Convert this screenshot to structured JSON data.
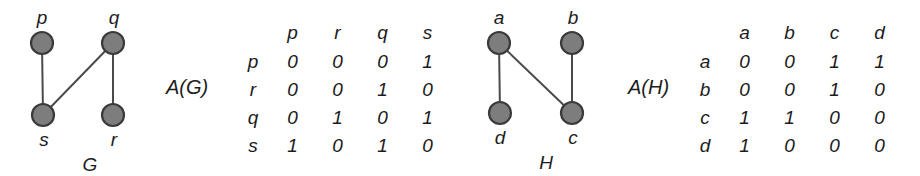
{
  "figure": {
    "background_color": "#ffffff",
    "ink_color": "#1c1c1c",
    "vertex_fill_color": "#7d7d7d",
    "vertex_stroke_color": "#3a3a3a",
    "edge_color": "#4a4a4a"
  },
  "graph_g": {
    "name": "G",
    "caption": "A(G)",
    "vertices": [
      {
        "id": "p",
        "label": "p",
        "cx": 42,
        "cy": 43,
        "r": 11,
        "label_x": 27,
        "label_y": 8
      },
      {
        "id": "q",
        "label": "q",
        "cx": 113,
        "cy": 43,
        "r": 11,
        "label_x": 99,
        "label_y": 8
      },
      {
        "id": "s",
        "label": "s",
        "cx": 43,
        "cy": 115,
        "r": 11,
        "label_x": 29,
        "label_y": 130
      },
      {
        "id": "r",
        "label": "r",
        "cx": 113,
        "cy": 115,
        "r": 11,
        "label_x": 99,
        "label_y": 130
      }
    ],
    "edges": [
      {
        "from": "p",
        "to": "s"
      },
      {
        "from": "s",
        "to": "q"
      },
      {
        "from": "q",
        "to": "r"
      }
    ],
    "name_x": 70,
    "name_y": 155
  },
  "graph_h": {
    "name": "H",
    "caption": "A(H)",
    "vertices": [
      {
        "id": "a",
        "label": "a",
        "cx": 41,
        "cy": 43,
        "r": 11,
        "label_x": 26,
        "label_y": 8
      },
      {
        "id": "b",
        "label": "b",
        "cx": 114,
        "cy": 43,
        "r": 11,
        "label_x": 100,
        "label_y": 8
      },
      {
        "id": "d",
        "label": "d",
        "cx": 42,
        "cy": 113,
        "r": 11,
        "label_x": 27,
        "label_y": 128
      },
      {
        "id": "c",
        "label": "c",
        "cx": 114,
        "cy": 113,
        "r": 11,
        "label_x": 100,
        "label_y": 128
      }
    ],
    "edges": [
      {
        "from": "a",
        "to": "d"
      },
      {
        "from": "a",
        "to": "c"
      },
      {
        "from": "b",
        "to": "c"
      }
    ],
    "name_x": 68,
    "name_y": 153
  },
  "matrix_ag": {
    "caption": "A(G)",
    "corner": "",
    "columns": [
      "p",
      "r",
      "q",
      "s"
    ],
    "rows": [
      {
        "label": "p",
        "values": [
          "0",
          "0",
          "0",
          "1"
        ]
      },
      {
        "label": "r",
        "values": [
          "0",
          "0",
          "1",
          "0"
        ]
      },
      {
        "label": "q",
        "values": [
          "0",
          "1",
          "0",
          "1"
        ]
      },
      {
        "label": "s",
        "values": [
          "1",
          "0",
          "1",
          "0"
        ]
      }
    ]
  },
  "matrix_ah": {
    "caption": "A(H)",
    "corner": "",
    "columns": [
      "a",
      "b",
      "c",
      "d"
    ],
    "rows": [
      {
        "label": "a",
        "values": [
          "0",
          "0",
          "1",
          "1"
        ]
      },
      {
        "label": "b",
        "values": [
          "0",
          "0",
          "1",
          "0"
        ]
      },
      {
        "label": "c",
        "values": [
          "1",
          "1",
          "0",
          "0"
        ]
      },
      {
        "label": "d",
        "values": [
          "1",
          "0",
          "0",
          "0"
        ]
      }
    ]
  }
}
